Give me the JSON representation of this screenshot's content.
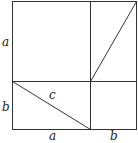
{
  "diagram": {
    "labels": {
      "left_top": "a",
      "left_bottom": "b",
      "hypotenuse": "c",
      "bottom_left": "a",
      "bottom_right": "b"
    },
    "stroke_color": "#333333"
  }
}
